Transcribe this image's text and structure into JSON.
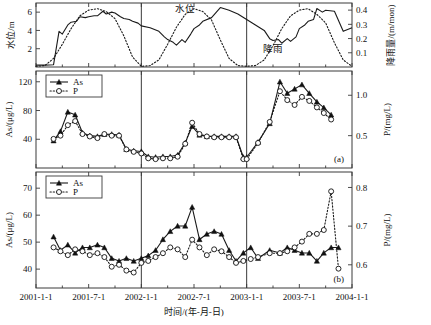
{
  "figure": {
    "xaxis": {
      "label": "时间/(年-月-日)",
      "ticks": [
        "2001-1-1",
        "2001-7-1",
        "2002-1-1",
        "2002-7-1",
        "2003-1-1",
        "2003-7-1",
        "2004-1-1"
      ],
      "range_start": "2001-1-1",
      "range_end": "2004-1-1"
    },
    "dividers": [
      "2002-1-1",
      "2003-1-1"
    ],
    "legend": {
      "as_label": "As",
      "p_label": "P",
      "as_marker": "filled-triangle",
      "p_marker": "open-circle",
      "as_line": "solid",
      "p_line": "dotted"
    },
    "colors": {
      "ink": "#111111",
      "frame": "#3a3a3a",
      "paper": "#ffffff"
    }
  },
  "chart_data": [
    {
      "type": "line",
      "panel": "top",
      "title": "",
      "xlabel": "",
      "ylabel": "水位/m",
      "ylim": [
        0,
        7
      ],
      "yticks": [
        2,
        4,
        6
      ],
      "y2label": "降雨量/(m/mon)",
      "y2lim": [
        0,
        0.45
      ],
      "y2ticks": [
        0.1,
        0.2,
        0.3,
        0.4
      ],
      "grid": false,
      "annotations": [
        {
          "text": "水位",
          "x": "2002-6-1",
          "y": 6.0
        },
        {
          "text": "降雨",
          "x": "2003-4-1",
          "y": 1.6
        }
      ],
      "series": [
        {
          "name": "水位",
          "axis": "left",
          "style": "solid",
          "x": [
            "2001-1-1",
            "2001-2-1",
            "2001-3-1",
            "2001-3-20",
            "2001-4-1",
            "2001-4-20",
            "2001-5-1",
            "2001-5-20",
            "2001-6-1",
            "2001-6-20",
            "2001-7-1",
            "2001-7-20",
            "2001-8-1",
            "2001-8-20",
            "2001-9-1",
            "2001-9-20",
            "2001-10-1",
            "2001-10-20",
            "2001-11-1",
            "2001-11-20",
            "2001-12-1",
            "2001-12-20",
            "2002-1-1",
            "2002-2-1",
            "2002-3-1",
            "2002-3-20",
            "2002-4-1",
            "2002-4-20",
            "2002-5-1",
            "2002-5-20",
            "2002-6-1",
            "2002-6-20",
            "2002-7-1",
            "2002-7-20",
            "2002-8-1",
            "2002-9-1",
            "2002-10-1",
            "2002-11-1",
            "2002-12-1",
            "2003-1-1",
            "2003-2-1",
            "2003-3-1",
            "2003-3-20",
            "2003-4-1",
            "2003-4-20",
            "2003-5-1",
            "2003-5-20",
            "2003-6-1",
            "2003-6-20",
            "2003-7-1",
            "2003-7-20",
            "2003-8-1",
            "2003-8-20",
            "2003-9-1",
            "2003-9-20",
            "2003-10-1",
            "2003-11-1",
            "2003-12-1",
            "2004-1-1"
          ],
          "values": [
            0.2,
            0.2,
            0.25,
            3.9,
            3.6,
            4.6,
            4.9,
            5.0,
            5.5,
            5.4,
            5.5,
            5.6,
            5.6,
            6.1,
            5.8,
            6.0,
            5.9,
            5.5,
            5.3,
            5.2,
            5.0,
            4.8,
            4.5,
            4.3,
            3.9,
            3.3,
            3.0,
            2.7,
            2.4,
            3.0,
            2.7,
            3.6,
            4.2,
            4.6,
            5.0,
            5.4,
            6.5,
            6.2,
            5.8,
            5.2,
            4.6,
            4.0,
            3.1,
            2.9,
            3.0,
            2.6,
            3.1,
            2.8,
            3.3,
            4.2,
            4.6,
            5.0,
            5.2,
            6.4,
            6.0,
            6.2,
            6.1,
            3.9,
            4.3
          ]
        },
        {
          "name": "降雨",
          "axis": "right",
          "style": "dotted",
          "x": [
            "2001-1-1",
            "2001-2-1",
            "2001-3-1",
            "2001-4-1",
            "2001-5-1",
            "2001-6-1",
            "2001-7-1",
            "2001-8-1",
            "2001-9-1",
            "2001-10-1",
            "2001-11-1",
            "2001-12-1",
            "2002-1-1",
            "2002-2-1",
            "2002-3-1",
            "2002-4-1",
            "2002-5-1",
            "2002-6-1",
            "2002-7-1",
            "2002-8-1",
            "2002-9-1",
            "2002-10-1",
            "2002-11-1",
            "2002-12-1",
            "2003-1-1",
            "2003-2-1",
            "2003-3-1",
            "2003-4-1",
            "2003-5-1",
            "2003-6-1",
            "2003-7-1",
            "2003-8-1",
            "2003-9-1",
            "2003-10-1",
            "2003-11-1",
            "2003-12-1",
            "2004-1-1"
          ],
          "values": [
            0.005,
            0.01,
            0.06,
            0.16,
            0.27,
            0.36,
            0.4,
            0.41,
            0.39,
            0.34,
            0.22,
            0.07,
            0.005,
            0.01,
            0.05,
            0.16,
            0.28,
            0.37,
            0.41,
            0.39,
            0.33,
            0.19,
            0.06,
            0.01,
            0.005,
            0.01,
            0.05,
            0.15,
            0.27,
            0.36,
            0.4,
            0.41,
            0.37,
            0.31,
            0.17,
            0.05,
            0.005
          ]
        }
      ]
    },
    {
      "type": "line",
      "panel": "a",
      "tag": "(a)",
      "title": "",
      "xlabel": "",
      "ylabel": "As/(μg/L)",
      "ylim": [
        0,
        135
      ],
      "yticks": [
        40,
        80,
        120
      ],
      "y2label": "P/(mg/L)",
      "y2lim": [
        0.1,
        1.3
      ],
      "y2ticks": [
        0.5,
        1.0
      ],
      "grid": false,
      "series": [
        {
          "name": "As",
          "axis": "left",
          "style": "solid",
          "marker": "filled-triangle",
          "x": [
            "2001-3-1",
            "2001-3-25",
            "2001-4-20",
            "2001-5-15",
            "2001-6-10",
            "2001-7-5",
            "2001-8-1",
            "2001-8-25",
            "2001-9-20",
            "2001-10-15",
            "2001-11-10",
            "2001-12-5",
            "2002-1-1",
            "2002-1-25",
            "2002-2-20",
            "2002-3-15",
            "2002-4-10",
            "2002-5-5",
            "2002-6-1",
            "2002-6-25",
            "2002-7-20",
            "2002-8-15",
            "2002-9-10",
            "2002-10-5",
            "2002-11-1",
            "2002-11-25",
            "2002-12-20",
            "2003-1-1",
            "2003-2-10",
            "2003-3-20",
            "2003-4-25",
            "2003-5-20",
            "2003-6-15",
            "2003-7-10",
            "2003-8-5",
            "2003-9-1",
            "2003-9-25",
            "2003-10-20"
          ],
          "values": [
            38,
            51,
            78,
            74,
            49,
            45,
            44,
            47,
            47,
            46,
            26,
            24,
            23,
            16,
            15,
            16,
            16,
            18,
            35,
            58,
            46,
            44,
            44,
            44,
            44,
            44,
            15,
            15,
            36,
            62,
            120,
            104,
            110,
            116,
            104,
            92,
            84,
            74
          ]
        },
        {
          "name": "P",
          "axis": "right",
          "style": "dotted",
          "marker": "open-circle",
          "x": [
            "2001-3-1",
            "2001-3-25",
            "2001-4-20",
            "2001-5-15",
            "2001-6-10",
            "2001-7-5",
            "2001-8-1",
            "2001-8-25",
            "2001-9-20",
            "2001-10-15",
            "2001-11-10",
            "2001-12-5",
            "2002-1-1",
            "2002-1-25",
            "2002-2-20",
            "2002-3-15",
            "2002-4-10",
            "2002-5-5",
            "2002-6-1",
            "2002-6-25",
            "2002-7-20",
            "2002-8-15",
            "2002-9-10",
            "2002-10-5",
            "2002-11-1",
            "2002-11-25",
            "2002-12-20",
            "2003-1-1",
            "2003-2-10",
            "2003-3-20",
            "2003-4-25",
            "2003-5-20",
            "2003-6-15",
            "2003-7-10",
            "2003-8-5",
            "2003-9-1",
            "2003-9-25",
            "2003-10-20"
          ],
          "values": [
            0.46,
            0.5,
            0.63,
            0.68,
            0.52,
            0.49,
            0.47,
            0.52,
            0.5,
            0.5,
            0.33,
            0.3,
            0.28,
            0.22,
            0.21,
            0.22,
            0.22,
            0.24,
            0.4,
            0.66,
            0.52,
            0.49,
            0.48,
            0.48,
            0.48,
            0.48,
            0.21,
            0.21,
            0.41,
            0.67,
            1.05,
            0.94,
            0.88,
            0.98,
            0.93,
            0.85,
            0.78,
            0.7
          ]
        }
      ]
    },
    {
      "type": "line",
      "panel": "b",
      "tag": "(b)",
      "title": "",
      "xlabel": "时间/(年-月-日)",
      "ylabel": "As/(μg/L)",
      "ylim": [
        33,
        76
      ],
      "yticks": [
        40,
        50,
        60,
        70
      ],
      "y2label": "P/(mg/L)",
      "y2lim": [
        0.54,
        0.84
      ],
      "y2ticks": [
        0.6,
        0.7,
        0.8
      ],
      "grid": false,
      "series": [
        {
          "name": "As",
          "axis": "left",
          "style": "solid",
          "marker": "filled-triangle",
          "x": [
            "2001-3-1",
            "2001-3-25",
            "2001-4-20",
            "2001-5-15",
            "2001-6-10",
            "2001-7-5",
            "2001-8-1",
            "2001-8-25",
            "2001-9-20",
            "2001-10-15",
            "2001-11-10",
            "2001-12-5",
            "2002-1-1",
            "2002-1-25",
            "2002-2-20",
            "2002-3-15",
            "2002-4-10",
            "2002-5-5",
            "2002-6-1",
            "2002-6-25",
            "2002-7-20",
            "2002-8-15",
            "2002-9-10",
            "2002-10-5",
            "2002-11-1",
            "2002-11-25",
            "2002-12-20",
            "2003-1-15",
            "2003-2-10",
            "2003-3-20",
            "2003-4-25",
            "2003-5-20",
            "2003-6-15",
            "2003-7-10",
            "2003-8-5",
            "2003-9-1",
            "2003-9-25",
            "2003-10-20",
            "2003-11-15"
          ],
          "values": [
            52,
            47,
            49,
            46,
            48,
            48,
            49,
            48,
            44,
            43,
            44,
            43,
            44,
            45,
            47,
            51,
            54,
            56,
            56,
            63,
            51,
            53,
            54,
            53,
            47,
            43,
            46,
            48,
            44,
            47,
            46,
            48,
            47,
            46,
            46,
            43,
            46,
            48,
            48
          ]
        },
        {
          "name": "P",
          "axis": "right",
          "style": "dotted",
          "marker": "open-circle",
          "x": [
            "2001-3-1",
            "2001-3-25",
            "2001-4-20",
            "2001-5-15",
            "2001-6-10",
            "2001-7-5",
            "2001-8-1",
            "2001-8-25",
            "2001-9-20",
            "2001-10-15",
            "2001-11-10",
            "2001-12-5",
            "2002-1-1",
            "2002-1-25",
            "2002-2-20",
            "2002-3-15",
            "2002-4-10",
            "2002-5-5",
            "2002-6-1",
            "2002-6-25",
            "2002-7-20",
            "2002-8-15",
            "2002-9-10",
            "2002-10-5",
            "2002-11-1",
            "2002-11-25",
            "2002-12-20",
            "2003-1-15",
            "2003-2-10",
            "2003-3-20",
            "2003-4-25",
            "2003-5-20",
            "2003-6-15",
            "2003-7-10",
            "2003-8-5",
            "2003-9-1",
            "2003-9-25",
            "2003-10-20",
            "2003-11-15"
          ],
          "values": [
            0.645,
            0.635,
            0.625,
            0.64,
            0.635,
            0.625,
            0.63,
            0.62,
            0.595,
            0.6,
            0.585,
            0.58,
            0.605,
            0.61,
            0.62,
            0.63,
            0.645,
            0.64,
            0.62,
            0.665,
            0.645,
            0.625,
            0.64,
            0.635,
            0.62,
            0.605,
            0.61,
            0.615,
            0.62,
            0.63,
            0.63,
            0.635,
            0.645,
            0.66,
            0.68,
            0.68,
            0.69,
            0.79,
            0.59
          ]
        }
      ]
    }
  ]
}
